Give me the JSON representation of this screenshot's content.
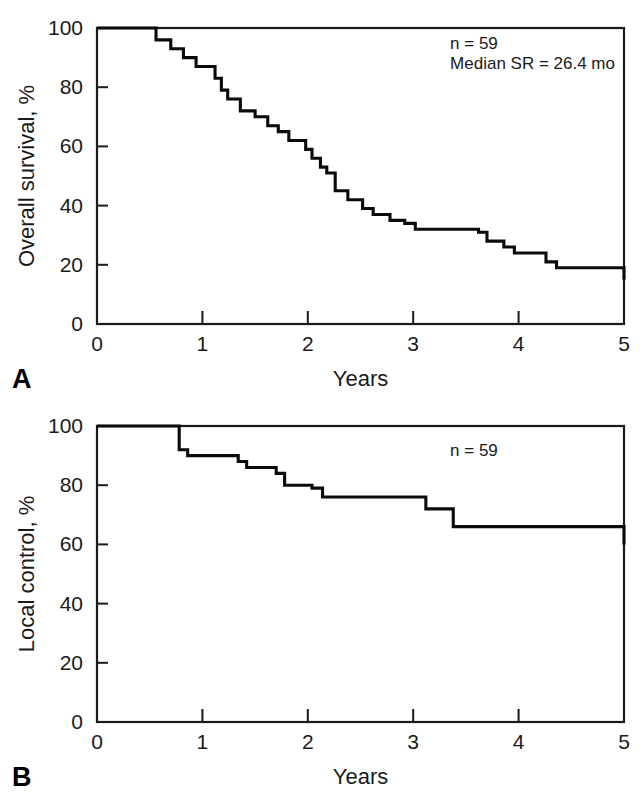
{
  "figure": {
    "panels": [
      {
        "letter": "A",
        "annotations": [
          "n = 59",
          "Median SR = 26.4 mo"
        ],
        "chart_index": 0
      },
      {
        "letter": "B",
        "annotations": [
          "n = 59"
        ],
        "chart_index": 1
      }
    ]
  },
  "chart_data": [
    {
      "type": "line",
      "subtype": "kaplan-meier-step",
      "title": "",
      "panel_label": "A",
      "xlabel": "Years",
      "ylabel": "Overall survival, %",
      "xlim": [
        0,
        5
      ],
      "ylim": [
        0,
        100
      ],
      "xticks": [
        0,
        1,
        2,
        3,
        4,
        5
      ],
      "xticklabels": [
        "0",
        "1",
        "2",
        "3",
        "4",
        "5"
      ],
      "yticks": [
        0,
        20,
        40,
        60,
        80,
        100
      ],
      "yticklabels": [
        "0",
        "20",
        "40",
        "60",
        "80",
        "100"
      ],
      "grid": false,
      "legend": null,
      "annotations": [
        {
          "text": "n = 59",
          "x": 3.35,
          "y": 93
        },
        {
          "text": "Median SR = 26.4 mo",
          "x": 3.35,
          "y": 86
        }
      ],
      "series": [
        {
          "name": "Overall survival",
          "step": "post",
          "x": [
            0.0,
            0.42,
            0.56,
            0.7,
            0.82,
            0.94,
            1.06,
            1.12,
            1.18,
            1.24,
            1.36,
            1.5,
            1.62,
            1.72,
            1.82,
            1.92,
            1.98,
            2.04,
            2.12,
            2.18,
            2.26,
            2.38,
            2.52,
            2.62,
            2.78,
            2.92,
            3.02,
            3.62,
            3.7,
            3.86,
            3.96,
            4.26,
            4.36,
            5.0
          ],
          "y": [
            100,
            100,
            96,
            93,
            90,
            87,
            87,
            83,
            79,
            76,
            72,
            70,
            67,
            65,
            62,
            62,
            59,
            56,
            53,
            51,
            45,
            42,
            39,
            37,
            35,
            34,
            32,
            31,
            28,
            26,
            24,
            21,
            19,
            15
          ]
        }
      ]
    },
    {
      "type": "line",
      "subtype": "kaplan-meier-step",
      "title": "",
      "panel_label": "B",
      "xlabel": "Years",
      "ylabel": "Local control, %",
      "xlim": [
        0,
        5
      ],
      "ylim": [
        0,
        100
      ],
      "xticks": [
        0,
        1,
        2,
        3,
        4,
        5
      ],
      "xticklabels": [
        "0",
        "1",
        "2",
        "3",
        "4",
        "5"
      ],
      "yticks": [
        0,
        20,
        40,
        60,
        80,
        100
      ],
      "yticklabels": [
        "0",
        "20",
        "40",
        "60",
        "80",
        "100"
      ],
      "grid": false,
      "legend": null,
      "annotations": [
        {
          "text": "n = 59",
          "x": 3.35,
          "y": 90
        }
      ],
      "series": [
        {
          "name": "Local control",
          "step": "post",
          "x": [
            0.0,
            0.72,
            0.78,
            0.86,
            1.34,
            1.42,
            1.7,
            1.78,
            2.04,
            2.14,
            3.12,
            3.22,
            3.38,
            5.0
          ],
          "y": [
            100,
            100,
            92,
            90,
            88,
            86,
            84,
            80,
            79,
            76,
            72,
            72,
            66,
            60
          ]
        }
      ]
    }
  ]
}
